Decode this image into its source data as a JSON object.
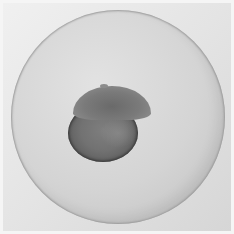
{
  "image": {
    "description": "Brightfield micrograph of an embryo inside a spherical chorion",
    "colors": {
      "background": "#f0f0f0",
      "chorion": "#d4d4d4",
      "yolk": "#6e6e6e",
      "blastoderm": "#7a7a7a"
    },
    "subjects": [
      "chorion",
      "yolk",
      "blastoderm"
    ]
  }
}
